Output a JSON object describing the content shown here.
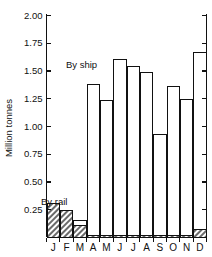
{
  "chart_data": {
    "type": "bar",
    "title": "",
    "subtitle": "",
    "xlabel": "",
    "ylabel": "Million tonnes",
    "ylim": [
      0,
      2.0
    ],
    "yticks": [
      0,
      0.25,
      0.5,
      0.75,
      1.0,
      1.25,
      1.5,
      1.75,
      2.0
    ],
    "ytick_labels": [
      "",
      "0.25",
      "0.50",
      "0.75",
      "1.00",
      "1.25",
      "1.50",
      "1.75",
      "2.00"
    ],
    "grid": false,
    "legend_position": "inline-annotations",
    "stacked": true,
    "categories": [
      "J",
      "F",
      "M",
      "A",
      "M",
      "J",
      "J",
      "A",
      "S",
      "O",
      "N",
      "D"
    ],
    "category_names": [
      "January",
      "February",
      "March",
      "April",
      "May",
      "June",
      "July",
      "August",
      "September",
      "October",
      "November",
      "December"
    ],
    "series": [
      {
        "name": "By rail",
        "style": "hatched",
        "values": [
          0.31,
          0.24,
          0.11,
          0.02,
          0.02,
          0.02,
          0.02,
          0.02,
          0.02,
          0.02,
          0.02,
          0.07
        ]
      },
      {
        "name": "By ship",
        "style": "open",
        "values": [
          0.0,
          0.0,
          0.04,
          1.36,
          1.21,
          1.58,
          1.52,
          1.47,
          0.91,
          1.34,
          1.22,
          1.6
        ]
      }
    ],
    "totals": [
      0.31,
      0.24,
      0.15,
      1.38,
      1.23,
      1.6,
      1.54,
      1.49,
      0.93,
      1.36,
      1.24,
      1.67
    ],
    "annotations": [
      {
        "text": "By ship",
        "x_category": "A",
        "y_value": 1.45
      },
      {
        "text": "By rail",
        "x_category": "J",
        "y_value": 0.37
      }
    ]
  },
  "axes": {
    "y_axis_title": "Million tonnes",
    "y_tick_labels": [
      "2.00",
      "1.75",
      "1.50",
      "1.25",
      "1.00",
      "0.75",
      "0.50",
      "0.25"
    ],
    "x_tick_labels": [
      "J",
      "F",
      "M",
      "A",
      "M",
      "J",
      "J",
      "A",
      "S",
      "O",
      "N",
      "D"
    ],
    "right_axis_visible": true
  },
  "annotations": {
    "by_ship": "By ship",
    "by_rail": "By rail"
  },
  "colors": {
    "axis": "#111111",
    "bar_outline": "#111111",
    "bar_ship_fill": "#ffffff",
    "bar_rail_hatch": "#555555",
    "background": "#ffffff"
  }
}
